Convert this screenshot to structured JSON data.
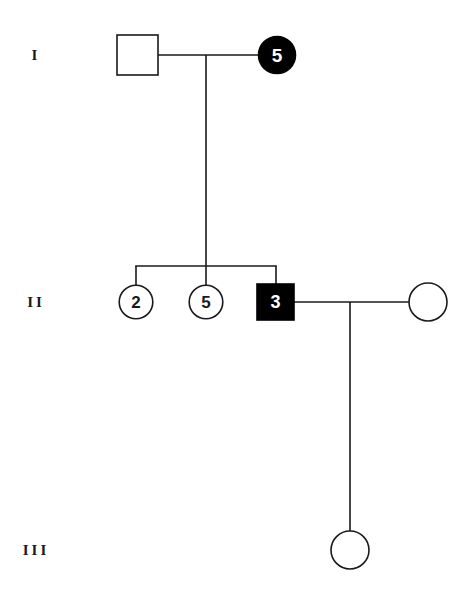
{
  "figure": {
    "type": "pedigree-chart",
    "background_color": "#ffffff",
    "line_color": "#1a1a1a",
    "affected_fill": "#000000",
    "unaffected_fill": "#ffffff",
    "affected_label_color": "#ffffff",
    "unaffected_label_color": "#1a1a1a"
  },
  "generation_labels": [
    {
      "id": "gen-1",
      "text": "I"
    },
    {
      "id": "gen-2",
      "text": "II"
    },
    {
      "id": "gen-3",
      "text": "III"
    }
  ],
  "individuals": [
    {
      "id": "i-1",
      "generation": "I",
      "sex": "male",
      "shape": "square",
      "affected": false,
      "count_label": "",
      "cx": 137,
      "cy": 55,
      "size": 41
    },
    {
      "id": "i-2",
      "generation": "I",
      "sex": "female",
      "shape": "circle",
      "affected": true,
      "count_label": "5",
      "cx": 277,
      "cy": 55,
      "size": 37
    },
    {
      "id": "ii-1",
      "generation": "II",
      "sex": "female",
      "shape": "circle",
      "affected": false,
      "count_label": "2",
      "cx": 136,
      "cy": 302,
      "size": 34
    },
    {
      "id": "ii-2",
      "generation": "II",
      "sex": "female",
      "shape": "circle",
      "affected": false,
      "count_label": "5",
      "cx": 206,
      "cy": 302,
      "size": 34
    },
    {
      "id": "ii-3",
      "generation": "II",
      "sex": "male",
      "shape": "square",
      "affected": true,
      "count_label": "3",
      "cx": 276,
      "cy": 302,
      "size": 37
    },
    {
      "id": "ii-4",
      "generation": "II",
      "sex": "female",
      "shape": "circle",
      "affected": false,
      "count_label": "",
      "cx": 428,
      "cy": 302,
      "size": 38
    },
    {
      "id": "iii-1",
      "generation": "III",
      "sex": "female",
      "shape": "circle",
      "affected": false,
      "count_label": "",
      "cx": 350,
      "cy": 550,
      "size": 38
    }
  ],
  "connections": [
    {
      "id": "mating-line-gen1",
      "kind": "mating",
      "x1": 158,
      "y1": 55,
      "x2": 259,
      "y2": 55
    },
    {
      "id": "descent-line-gen1",
      "kind": "descent",
      "x1": 206,
      "y1": 55,
      "x2": 206,
      "y2": 266
    },
    {
      "id": "sibship-bar-gen2",
      "kind": "sibship",
      "x1": 136,
      "y1": 266,
      "x2": 276,
      "y2": 266
    },
    {
      "id": "sib-drop-ii-1",
      "kind": "sibling-drop",
      "x1": 136,
      "y1": 266,
      "x2": 136,
      "y2": 285
    },
    {
      "id": "sib-drop-ii-2",
      "kind": "sibling-drop",
      "x1": 206,
      "y1": 266,
      "x2": 206,
      "y2": 285
    },
    {
      "id": "sib-drop-ii-3",
      "kind": "sibling-drop",
      "x1": 276,
      "y1": 266,
      "x2": 276,
      "y2": 284
    },
    {
      "id": "mating-line-gen2",
      "kind": "mating",
      "x1": 294,
      "y1": 302,
      "x2": 409,
      "y2": 302
    },
    {
      "id": "descent-line-gen2",
      "kind": "descent",
      "x1": 350,
      "y1": 302,
      "x2": 350,
      "y2": 531
    }
  ],
  "legend_positions": {
    "gen_label_x": 36,
    "gen_1_y": 55,
    "gen_2_y": 302,
    "gen_3_y": 550
  }
}
